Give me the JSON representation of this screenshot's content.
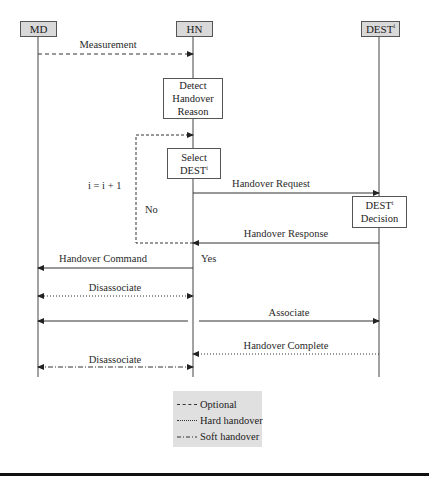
{
  "diagram": {
    "type": "sequence",
    "lifelines": [
      {
        "id": "md",
        "label": "MD",
        "x": 38
      },
      {
        "id": "hn",
        "label": "HN",
        "x": 193
      },
      {
        "id": "dest",
        "label": "DEST",
        "sup": "i",
        "x": 379
      }
    ],
    "activities": {
      "detect": {
        "lines": [
          "Detect",
          "Handover",
          "Reason"
        ]
      },
      "select": {
        "lines": [
          "Select",
          "DEST"
        ],
        "sup": "i"
      },
      "decision": {
        "lines": [
          "DEST",
          "Decision"
        ],
        "sup": "i"
      }
    },
    "loop": {
      "counter_label": "i = i + 1",
      "no_label": "No",
      "yes_label": "Yes"
    },
    "messages": [
      {
        "label": "Measurement",
        "from": "MD",
        "to": "HN",
        "style": "dashed",
        "meaning": "Optional"
      },
      {
        "label": "Handover Request",
        "from": "HN",
        "to": "DEST",
        "style": "solid"
      },
      {
        "label": "Handover Response",
        "from": "DEST",
        "to": "HN",
        "style": "solid"
      },
      {
        "label": "Handover Command",
        "from": "HN",
        "to": "MD",
        "style": "solid"
      },
      {
        "label": "Disassociate",
        "from": "MD",
        "to": "HN",
        "style": "dotted",
        "bidirectional": true,
        "meaning": "Hard handover"
      },
      {
        "label": "Associate",
        "from": "MD",
        "to": "DEST",
        "style": "solid"
      },
      {
        "label": "Handover Complete",
        "from": "DEST",
        "to": "HN",
        "style": "dotted",
        "meaning": "Hard handover"
      },
      {
        "label": "Disassociate",
        "from": "MD",
        "to": "HN",
        "style": "dash-dot",
        "bidirectional": true,
        "meaning": "Soft handover"
      }
    ]
  },
  "legend": {
    "items": [
      {
        "style": "dashed",
        "label": "Optional"
      },
      {
        "style": "dotted",
        "label": "Hard handover"
      },
      {
        "style": "dash-dot",
        "label": "Soft handover"
      }
    ]
  }
}
